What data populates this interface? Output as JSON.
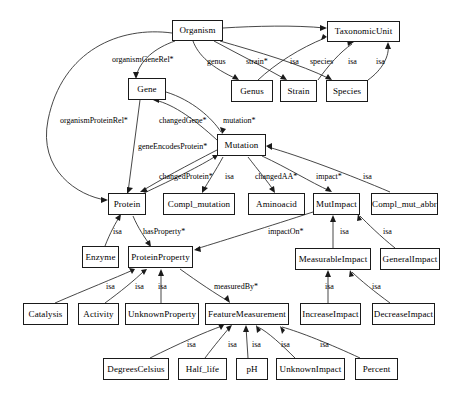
{
  "diagram": {
    "type": "ontology-class-hierarchy",
    "title": "",
    "nodes": [
      {
        "id": "Organism",
        "label": "Organism",
        "x": 172,
        "y": 20,
        "w": 51,
        "h": 21
      },
      {
        "id": "TaxonomicUnit",
        "label": "TaxonomicUnit",
        "x": 327,
        "y": 21,
        "w": 73,
        "h": 21
      },
      {
        "id": "Gene",
        "label": "Gene",
        "x": 128,
        "y": 78,
        "w": 38,
        "h": 22
      },
      {
        "id": "Genus",
        "label": "Genus",
        "x": 231,
        "y": 80,
        "w": 42,
        "h": 22
      },
      {
        "id": "Strain",
        "label": "Strain",
        "x": 280,
        "y": 80,
        "w": 37,
        "h": 22
      },
      {
        "id": "Species",
        "label": "Species",
        "x": 326,
        "y": 80,
        "w": 42,
        "h": 22
      },
      {
        "id": "Mutation",
        "label": "Mutation",
        "x": 217,
        "y": 134,
        "w": 49,
        "h": 22
      },
      {
        "id": "Protein",
        "label": "Protein",
        "x": 108,
        "y": 193,
        "w": 38,
        "h": 22
      },
      {
        "id": "Compl_mutation",
        "label": "Compl_mutation",
        "x": 163,
        "y": 193,
        "w": 72,
        "h": 22
      },
      {
        "id": "Aminoacid",
        "label": "Aminoacid",
        "x": 248,
        "y": 193,
        "w": 57,
        "h": 22
      },
      {
        "id": "MutImpact",
        "label": "MutImpact",
        "x": 313,
        "y": 193,
        "w": 47,
        "h": 22
      },
      {
        "id": "Compl_mut_abbr",
        "label": "Compl_mut_abbr",
        "x": 371,
        "y": 193,
        "w": 67,
        "h": 22
      },
      {
        "id": "Enzyme",
        "label": "Enzyme",
        "x": 82,
        "y": 246,
        "w": 37,
        "h": 22
      },
      {
        "id": "ProteinProperty",
        "label": "ProteinProperty",
        "x": 128,
        "y": 246,
        "w": 65,
        "h": 22
      },
      {
        "id": "MeasurableImpact",
        "label": "MeasurableImpact",
        "x": 295,
        "y": 248,
        "w": 76,
        "h": 22
      },
      {
        "id": "GeneralImpact",
        "label": "GeneralImpact",
        "x": 380,
        "y": 248,
        "w": 60,
        "h": 22
      },
      {
        "id": "Catalysis",
        "label": "Catalysis",
        "x": 23,
        "y": 303,
        "w": 45,
        "h": 22
      },
      {
        "id": "Activity",
        "label": "Activity",
        "x": 78,
        "y": 303,
        "w": 41,
        "h": 22
      },
      {
        "id": "UnknownProperty",
        "label": "UnknownProperty",
        "x": 125,
        "y": 303,
        "w": 74,
        "h": 22
      },
      {
        "id": "FeatureMeasurement",
        "label": "FeatureMeasurement",
        "x": 205,
        "y": 303,
        "w": 84,
        "h": 22
      },
      {
        "id": "IncreaseImpact",
        "label": "IncreaseImpact",
        "x": 300,
        "y": 303,
        "w": 61,
        "h": 22
      },
      {
        "id": "DecreaseImpact",
        "label": "DecreaseImpact",
        "x": 372,
        "y": 303,
        "w": 63,
        "h": 22
      },
      {
        "id": "DegreesCelsius",
        "label": "DegreesCelsius",
        "x": 103,
        "y": 358,
        "w": 66,
        "h": 22
      },
      {
        "id": "Half_life",
        "label": "Half_life",
        "x": 178,
        "y": 358,
        "w": 49,
        "h": 22
      },
      {
        "id": "pH",
        "label": "pH",
        "x": 236,
        "y": 358,
        "w": 32,
        "h": 22
      },
      {
        "id": "UnknownImpact",
        "label": "UnknownImpact",
        "x": 276,
        "y": 358,
        "w": 69,
        "h": 22
      },
      {
        "id": "Percent",
        "label": "Percent",
        "x": 355,
        "y": 358,
        "w": 43,
        "h": 22
      }
    ],
    "edge_labels": [
      {
        "id": "organismGeneRel",
        "text": "organismGeneRel*",
        "x": 112,
        "y": 56
      },
      {
        "id": "genus",
        "text": "genus",
        "x": 207,
        "y": 58
      },
      {
        "id": "strain",
        "text": "strain*",
        "x": 246,
        "y": 58
      },
      {
        "id": "isa-taxon-1",
        "text": "isa",
        "x": 290,
        "y": 58
      },
      {
        "id": "species",
        "text": "species",
        "x": 310,
        "y": 58
      },
      {
        "id": "isa-taxon-2",
        "text": "isa",
        "x": 348,
        "y": 58
      },
      {
        "id": "isa-taxon-3",
        "text": "isa",
        "x": 376,
        "y": 58
      },
      {
        "id": "organismProteinRel",
        "text": "organismProteinRel*",
        "x": 60,
        "y": 117
      },
      {
        "id": "changedGene",
        "text": "changedGene*",
        "x": 159,
        "y": 117
      },
      {
        "id": "mutation",
        "text": "mutation*",
        "x": 223,
        "y": 117
      },
      {
        "id": "geneEncodesProtein",
        "text": "geneEncodesProtein*",
        "x": 138,
        "y": 143
      },
      {
        "id": "changedProtein",
        "text": "changedProtein*",
        "x": 159,
        "y": 173
      },
      {
        "id": "isa-mut-1",
        "text": "isa",
        "x": 225,
        "y": 173
      },
      {
        "id": "changedAA",
        "text": "changedAA*",
        "x": 255,
        "y": 173
      },
      {
        "id": "impact",
        "text": "impact*",
        "x": 316,
        "y": 173
      },
      {
        "id": "isa-mut-2",
        "text": "isa",
        "x": 363,
        "y": 173
      },
      {
        "id": "isa-enzyme",
        "text": "isa",
        "x": 113,
        "y": 228
      },
      {
        "id": "hasProperty",
        "text": "hasProperty*",
        "x": 143,
        "y": 228
      },
      {
        "id": "impactOn",
        "text": "impactOn*",
        "x": 268,
        "y": 228
      },
      {
        "id": "isa-mi",
        "text": "isa",
        "x": 340,
        "y": 228
      },
      {
        "id": "isa-gi",
        "text": "isa",
        "x": 383,
        "y": 228
      },
      {
        "id": "isa-pp-1",
        "text": "isa",
        "x": 106,
        "y": 283
      },
      {
        "id": "isa-pp-2",
        "text": "isa",
        "x": 135,
        "y": 283
      },
      {
        "id": "isa-pp-3",
        "text": "isa",
        "x": 158,
        "y": 283
      },
      {
        "id": "measuredBy",
        "text": "measuredBy*",
        "x": 214,
        "y": 283
      },
      {
        "id": "isa-ii",
        "text": "isa",
        "x": 325,
        "y": 283
      },
      {
        "id": "isa-di",
        "text": "isa",
        "x": 372,
        "y": 283
      },
      {
        "id": "isa-fm-1",
        "text": "isa",
        "x": 187,
        "y": 341
      },
      {
        "id": "isa-fm-2",
        "text": "isa",
        "x": 228,
        "y": 341
      },
      {
        "id": "isa-fm-3",
        "text": "isa",
        "x": 252,
        "y": 341
      },
      {
        "id": "isa-fm-4",
        "text": "isa",
        "x": 281,
        "y": 341
      },
      {
        "id": "isa-fm-5",
        "text": "isa",
        "x": 320,
        "y": 341
      }
    ],
    "colors": {
      "node_border": "#1a1a1a",
      "node_fill": "#ffffff",
      "edge_stroke": "#262626",
      "text": "#000000",
      "background": "#ffffff"
    }
  }
}
